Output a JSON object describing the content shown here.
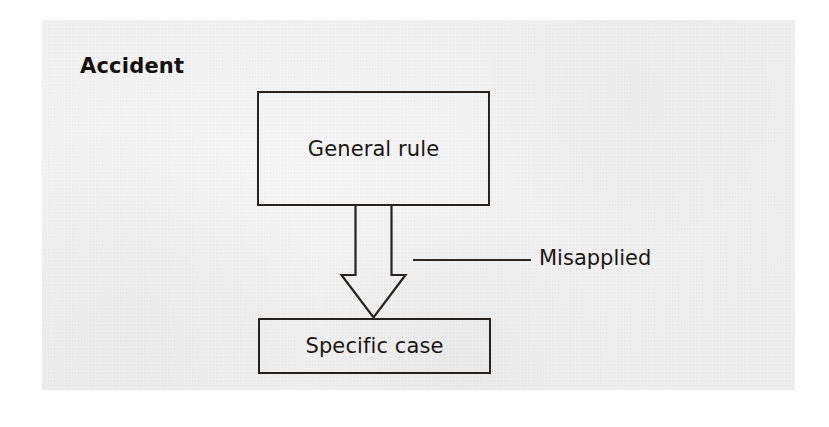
{
  "figure": {
    "title": "Accident",
    "nodes": [
      {
        "id": "general-rule",
        "label": "General rule"
      },
      {
        "id": "specific-case",
        "label": "Specific case"
      }
    ],
    "connector": {
      "kind": "block-arrow-down",
      "from": "general-rule",
      "to": "specific-case",
      "annotation": "Misapplied"
    },
    "colors": {
      "ink": "#1a1715",
      "stroke": "#262320",
      "paper": "#f1f1f1",
      "page": "#ffffff"
    }
  }
}
